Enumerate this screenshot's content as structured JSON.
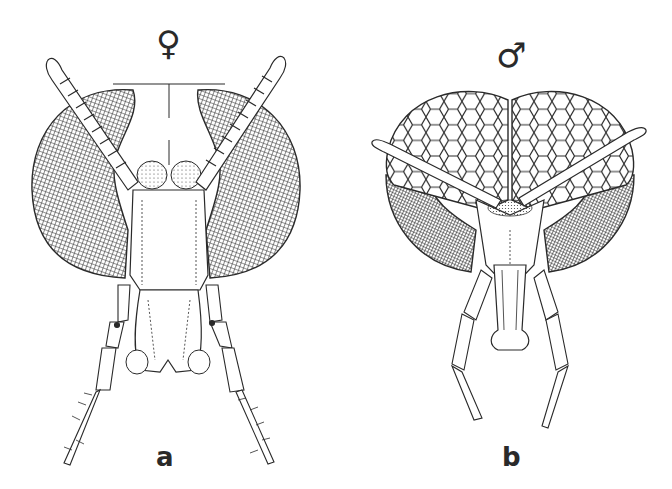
{
  "figure": {
    "panels": [
      {
        "id": "a",
        "label": "a",
        "sex_symbol": "♀",
        "sex": "female",
        "subject": "insect head, frontal view",
        "eye_style": "finely cross-hatched, widely separated"
      },
      {
        "id": "b",
        "label": "b",
        "sex_symbol": "♂",
        "sex": "male",
        "subject": "insect head, frontal view",
        "eye_style": "large facets above, fine hatching below, eyes meeting at midline"
      }
    ],
    "colors": {
      "ink": "#2a2a2a",
      "background": "#ffffff"
    }
  }
}
